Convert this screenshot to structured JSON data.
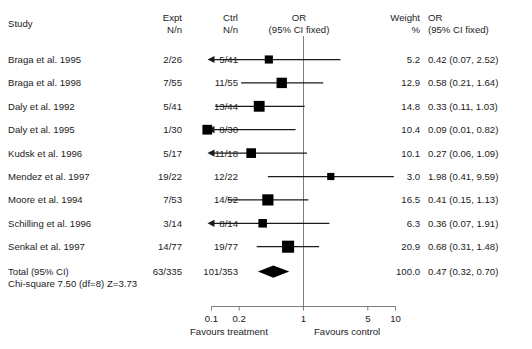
{
  "header": {
    "study": "Study",
    "expt_l1": "Expt",
    "expt_l2": "N/n",
    "ctrl_l1": "Ctrl",
    "ctrl_l2": "N/n",
    "or_l1": "OR",
    "or_l2": "(95% CI fixed)",
    "weight_l1": "Weight",
    "weight_l2": "%",
    "or_right_l1": "OR",
    "or_right_l2": "(95% CI fixed)"
  },
  "footer": {
    "total_label": "Total (95% CI)",
    "total_expt": "63/335",
    "total_ctrl": "101/353",
    "total_weight": "100.0",
    "total_or": "0.47 (0.32, 0.70)",
    "heterogeneity": "Chi-square 7.50 (df=8) Z=3.73",
    "favours_treatment": "Favours treatment",
    "favours_control": "Favours control"
  },
  "chart_data": {
    "type": "forest",
    "title": "",
    "xlabel": "",
    "ylabel": "",
    "effect_measure": "OR",
    "model": "fixed",
    "scale": "log",
    "xlim": [
      0.09,
      11.5
    ],
    "ticks": [
      0.1,
      0.2,
      1,
      5,
      10
    ],
    "tick_labels": [
      "0.1",
      "0.2",
      "1",
      "5",
      "10"
    ],
    "null_line": 1,
    "grid": false,
    "left_side_label": "Favours treatment",
    "right_side_label": "Favours control",
    "studies": [
      {
        "label": "Braga et al. 1995",
        "expt": "2/26",
        "expt_events": 2,
        "expt_total": 26,
        "ctrl": "5/41",
        "ctrl_events": 5,
        "ctrl_total": 41,
        "weight": 5.2,
        "or": 0.42,
        "ci_low": 0.07,
        "ci_high": 2.52,
        "or_text": "0.42 (0.07, 2.52)",
        "clip_low": true,
        "clip_high": false
      },
      {
        "label": "Braga et al. 1998",
        "expt": "7/55",
        "expt_events": 7,
        "expt_total": 55,
        "ctrl": "11/55",
        "ctrl_events": 11,
        "ctrl_total": 55,
        "weight": 12.9,
        "or": 0.58,
        "ci_low": 0.21,
        "ci_high": 1.64,
        "or_text": "0.58 (0.21, 1.64)",
        "clip_low": false,
        "clip_high": false
      },
      {
        "label": "Daly et al. 1992",
        "expt": "5/41",
        "expt_events": 5,
        "expt_total": 41,
        "ctrl": "13/44",
        "ctrl_events": 13,
        "ctrl_total": 44,
        "weight": 14.8,
        "or": 0.33,
        "ci_low": 0.11,
        "ci_high": 1.03,
        "or_text": "0.33 (0.11, 1.03)",
        "clip_low": false,
        "clip_high": false
      },
      {
        "label": "Daly et al. 1995",
        "expt": "1/30",
        "expt_events": 1,
        "expt_total": 30,
        "ctrl": "8/30",
        "ctrl_events": 8,
        "ctrl_total": 30,
        "weight": 10.4,
        "or": 0.09,
        "ci_low": 0.01,
        "ci_high": 0.82,
        "or_text": "0.09 (0.01, 0.82)",
        "clip_low": true,
        "clip_high": false
      },
      {
        "label": "Kudsk et al. 1996",
        "expt": "5/17",
        "expt_events": 5,
        "expt_total": 17,
        "ctrl": "11/18",
        "ctrl_events": 11,
        "ctrl_total": 18,
        "weight": 10.1,
        "or": 0.27,
        "ci_low": 0.06,
        "ci_high": 1.09,
        "or_text": "0.27 (0.06, 1.09)",
        "clip_low": true,
        "clip_high": false
      },
      {
        "label": "Mendez et al. 1997",
        "expt": "19/22",
        "expt_events": 19,
        "expt_total": 22,
        "ctrl": "12/22",
        "ctrl_events": 12,
        "ctrl_total": 22,
        "weight": 3.0,
        "or": 1.98,
        "ci_low": 0.41,
        "ci_high": 9.59,
        "or_text": "1.98 (0.41, 9.59)",
        "clip_low": false,
        "clip_high": false
      },
      {
        "label": "Moore et al. 1994",
        "expt": "7/53",
        "expt_events": 7,
        "expt_total": 53,
        "ctrl": "14/52",
        "ctrl_events": 14,
        "ctrl_total": 52,
        "weight": 16.5,
        "or": 0.41,
        "ci_low": 0.15,
        "ci_high": 1.13,
        "or_text": "0.41 (0.15, 1.13)",
        "clip_low": false,
        "clip_high": false
      },
      {
        "label": "Schilling et al. 1996",
        "expt": "3/14",
        "expt_events": 3,
        "expt_total": 14,
        "ctrl": "8/14",
        "ctrl_events": 8,
        "ctrl_total": 14,
        "weight": 6.3,
        "or": 0.36,
        "ci_low": 0.07,
        "ci_high": 1.91,
        "or_text": "0.36 (0.07, 1.91)",
        "clip_low": true,
        "clip_high": false
      },
      {
        "label": "Senkal et al. 1997",
        "expt": "14/77",
        "expt_events": 14,
        "expt_total": 77,
        "ctrl": "19/77",
        "ctrl_events": 19,
        "ctrl_total": 77,
        "weight": 20.9,
        "or": 0.68,
        "ci_low": 0.31,
        "ci_high": 1.48,
        "or_text": "0.68 (0.31, 1.48)",
        "clip_low": false,
        "clip_high": false
      }
    ],
    "total": {
      "label": "Total (95% CI)",
      "expt": "63/335",
      "expt_events": 63,
      "expt_total": 335,
      "ctrl": "101/353",
      "ctrl_events": 101,
      "ctrl_total": 353,
      "weight": 100.0,
      "or": 0.47,
      "ci_low": 0.32,
      "ci_high": 0.7,
      "or_text": "0.47 (0.32, 0.70)"
    },
    "heterogeneity": {
      "chi_square": 7.5,
      "df": 8,
      "z": 3.73,
      "text": "Chi-square 7.50 (df=8) Z=3.73"
    }
  },
  "colors": {
    "marker": "#000000",
    "line": "#1a1a1a",
    "axis": "#6e6e6e",
    "text": "#1c1c1c",
    "background": "#ffffff"
  }
}
